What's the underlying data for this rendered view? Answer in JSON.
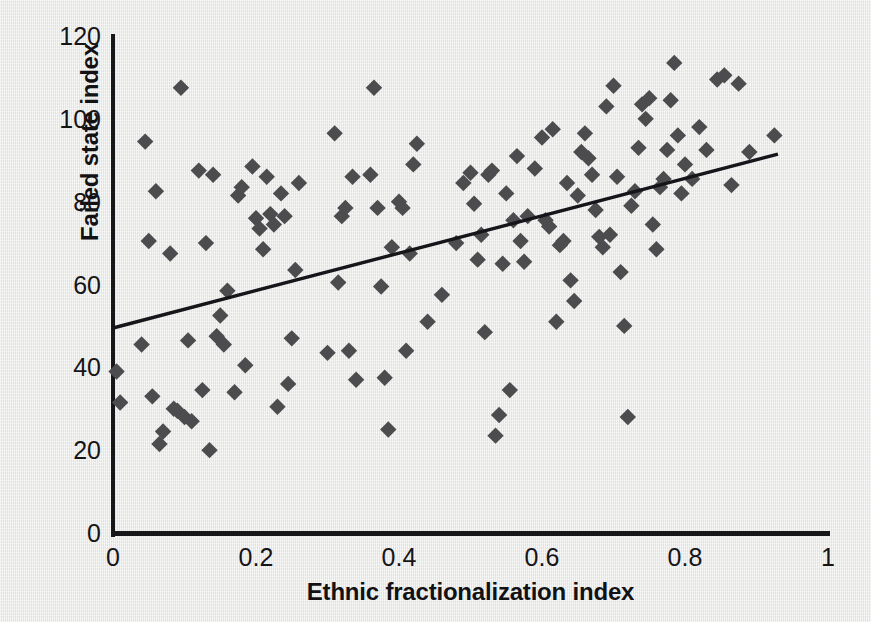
{
  "chart_data": {
    "type": "scatter",
    "title": "",
    "subtitle": "",
    "xlabel": "Ethnic fractionalization index",
    "ylabel": "Failed state index",
    "xlim": [
      0,
      1
    ],
    "ylim": [
      0,
      120
    ],
    "xticks": [
      "0",
      "0.2",
      "0.4",
      "0.6",
      "0.8",
      "1"
    ],
    "xtick_values": [
      0,
      0.2,
      0.4,
      0.6,
      0.8,
      1
    ],
    "yticks": [
      "0",
      "20",
      "40",
      "60",
      "80",
      "100",
      "120"
    ],
    "ytick_values": [
      0,
      20,
      40,
      60,
      80,
      100,
      120
    ],
    "grid": false,
    "legend": null,
    "marker": "diamond",
    "marker_color": "#4c4c4e",
    "background_color": "#e9e9e7",
    "axis_color": "#17171a",
    "trendline": {
      "type": "line",
      "color": "#15151a",
      "x": [
        0.0,
        0.93
      ],
      "y": [
        49.5,
        91.5
      ]
    },
    "series": [
      {
        "name": "Countries",
        "points": [
          [
            0.005,
            39.0
          ],
          [
            0.01,
            31.5
          ],
          [
            0.04,
            45.5
          ],
          [
            0.045,
            94.5
          ],
          [
            0.05,
            70.5
          ],
          [
            0.055,
            33.0
          ],
          [
            0.06,
            82.5
          ],
          [
            0.065,
            21.5
          ],
          [
            0.07,
            24.5
          ],
          [
            0.08,
            67.5
          ],
          [
            0.085,
            30.0
          ],
          [
            0.09,
            29.5
          ],
          [
            0.095,
            107.5
          ],
          [
            0.1,
            28.0
          ],
          [
            0.105,
            46.5
          ],
          [
            0.11,
            27.0
          ],
          [
            0.12,
            87.5
          ],
          [
            0.125,
            34.5
          ],
          [
            0.13,
            70.0
          ],
          [
            0.135,
            20.0
          ],
          [
            0.14,
            86.5
          ],
          [
            0.145,
            47.5
          ],
          [
            0.15,
            52.5
          ],
          [
            0.155,
            45.5
          ],
          [
            0.16,
            58.5
          ],
          [
            0.17,
            34.0
          ],
          [
            0.175,
            81.5
          ],
          [
            0.18,
            83.5
          ],
          [
            0.185,
            40.5
          ],
          [
            0.195,
            88.5
          ],
          [
            0.2,
            76.0
          ],
          [
            0.205,
            73.5
          ],
          [
            0.21,
            68.5
          ],
          [
            0.215,
            86.0
          ],
          [
            0.22,
            77.0
          ],
          [
            0.225,
            74.5
          ],
          [
            0.23,
            30.5
          ],
          [
            0.235,
            82.0
          ],
          [
            0.24,
            76.5
          ],
          [
            0.245,
            36.0
          ],
          [
            0.25,
            47.0
          ],
          [
            0.255,
            63.5
          ],
          [
            0.26,
            84.5
          ],
          [
            0.3,
            43.5
          ],
          [
            0.31,
            96.5
          ],
          [
            0.315,
            60.5
          ],
          [
            0.32,
            76.5
          ],
          [
            0.325,
            78.5
          ],
          [
            0.33,
            44.0
          ],
          [
            0.335,
            86.0
          ],
          [
            0.34,
            37.0
          ],
          [
            0.36,
            86.5
          ],
          [
            0.365,
            107.5
          ],
          [
            0.37,
            78.5
          ],
          [
            0.375,
            59.5
          ],
          [
            0.38,
            37.5
          ],
          [
            0.385,
            25.0
          ],
          [
            0.39,
            69.0
          ],
          [
            0.4,
            80.0
          ],
          [
            0.405,
            78.5
          ],
          [
            0.41,
            44.0
          ],
          [
            0.415,
            67.5
          ],
          [
            0.42,
            89.0
          ],
          [
            0.425,
            94.0
          ],
          [
            0.44,
            51.0
          ],
          [
            0.46,
            57.5
          ],
          [
            0.48,
            70.0
          ],
          [
            0.49,
            84.5
          ],
          [
            0.5,
            87.0
          ],
          [
            0.505,
            79.5
          ],
          [
            0.51,
            66.0
          ],
          [
            0.515,
            72.0
          ],
          [
            0.52,
            48.5
          ],
          [
            0.525,
            86.5
          ],
          [
            0.53,
            87.5
          ],
          [
            0.535,
            23.5
          ],
          [
            0.54,
            28.5
          ],
          [
            0.545,
            65.0
          ],
          [
            0.55,
            82.0
          ],
          [
            0.555,
            34.5
          ],
          [
            0.56,
            75.5
          ],
          [
            0.565,
            91.0
          ],
          [
            0.57,
            70.5
          ],
          [
            0.575,
            65.5
          ],
          [
            0.58,
            76.5
          ],
          [
            0.59,
            88.0
          ],
          [
            0.6,
            95.5
          ],
          [
            0.605,
            75.5
          ],
          [
            0.61,
            74.0
          ],
          [
            0.615,
            97.5
          ],
          [
            0.62,
            51.0
          ],
          [
            0.625,
            69.5
          ],
          [
            0.63,
            70.5
          ],
          [
            0.635,
            84.5
          ],
          [
            0.64,
            61.0
          ],
          [
            0.645,
            56.0
          ],
          [
            0.65,
            81.5
          ],
          [
            0.655,
            92.0
          ],
          [
            0.66,
            96.5
          ],
          [
            0.665,
            90.5
          ],
          [
            0.67,
            86.5
          ],
          [
            0.675,
            78.0
          ],
          [
            0.68,
            71.5
          ],
          [
            0.685,
            69.0
          ],
          [
            0.69,
            103.0
          ],
          [
            0.695,
            72.0
          ],
          [
            0.7,
            108.0
          ],
          [
            0.705,
            86.0
          ],
          [
            0.71,
            63.0
          ],
          [
            0.715,
            50.0
          ],
          [
            0.72,
            28.0
          ],
          [
            0.725,
            79.0
          ],
          [
            0.73,
            82.5
          ],
          [
            0.735,
            93.0
          ],
          [
            0.74,
            103.5
          ],
          [
            0.745,
            100.0
          ],
          [
            0.75,
            105.0
          ],
          [
            0.755,
            74.5
          ],
          [
            0.76,
            68.5
          ],
          [
            0.765,
            83.5
          ],
          [
            0.77,
            85.5
          ],
          [
            0.775,
            92.5
          ],
          [
            0.78,
            104.5
          ],
          [
            0.785,
            113.5
          ],
          [
            0.79,
            96.0
          ],
          [
            0.795,
            82.0
          ],
          [
            0.8,
            89.0
          ],
          [
            0.81,
            85.5
          ],
          [
            0.82,
            98.0
          ],
          [
            0.83,
            92.5
          ],
          [
            0.845,
            109.5
          ],
          [
            0.855,
            110.5
          ],
          [
            0.865,
            84.0
          ],
          [
            0.875,
            108.5
          ],
          [
            0.89,
            92.0
          ],
          [
            0.925,
            96.0
          ]
        ]
      }
    ]
  }
}
